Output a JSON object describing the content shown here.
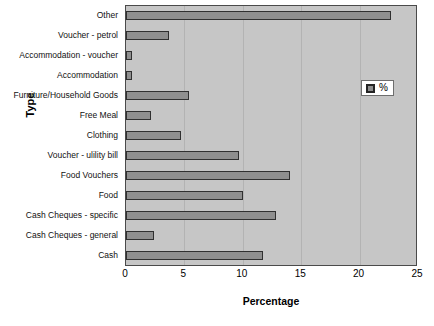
{
  "chart_data": {
    "type": "bar",
    "orientation": "horizontal",
    "title": "",
    "xlabel": "Percentage",
    "ylabel": "Type",
    "xlim": [
      0,
      25
    ],
    "xticks": [
      0,
      5,
      10,
      15,
      20,
      25
    ],
    "grid": true,
    "legend": {
      "position": "inside-top-right",
      "entries": [
        {
          "name": "%",
          "color": "#8f8f8f"
        }
      ]
    },
    "categories": [
      "Other",
      "Voucher - petrol",
      "Accommodation - voucher",
      "Accommodation",
      "Furniture/Household Goods",
      "Free Meal",
      "Clothing",
      "Voucher - ulility bill",
      "Food Vouchers",
      "Food",
      "Cash Cheques - specific",
      "Cash Cheques - general",
      "Cash"
    ],
    "values": [
      22.7,
      3.7,
      0.5,
      0.5,
      5.4,
      2.1,
      4.7,
      9.7,
      14.0,
      10.0,
      12.8,
      2.4,
      11.7
    ],
    "series": [
      {
        "name": "%",
        "values": [
          22.7,
          3.7,
          0.5,
          0.5,
          5.4,
          2.1,
          4.7,
          9.7,
          14.0,
          10.0,
          12.8,
          2.4,
          11.7
        ]
      }
    ],
    "colors": {
      "bar_fill": "#8f8f8f",
      "bar_outline": "#303030",
      "plot_background": "#c6c6c6",
      "gridline": "#b3b3b3",
      "axis": "#4a4a4a"
    }
  }
}
